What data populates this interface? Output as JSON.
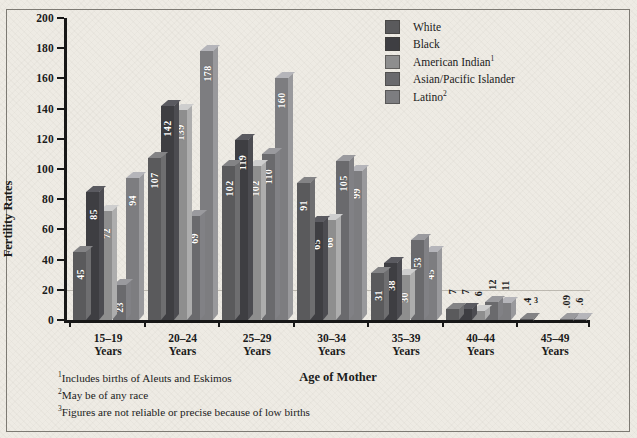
{
  "chart_data": {
    "type": "bar",
    "title": "",
    "xlabel": "Age of Mother",
    "ylabel": "Fertility Rates",
    "ylim": [
      0,
      200
    ],
    "yticks": [
      0,
      20,
      40,
      60,
      80,
      100,
      120,
      140,
      160,
      180,
      200
    ],
    "grid": "single horizontal gridline near 20",
    "legend_position": "top-right",
    "categories": [
      "15–19\nYears",
      "20–24\nYears",
      "25–29\nYears",
      "30–34\nYears",
      "35–39\nYears",
      "40–44\nYears",
      "45–49\nYears"
    ],
    "series": [
      {
        "name": "White",
        "values": [
          45,
          107,
          102,
          91,
          31,
          7,
          0.4
        ],
        "labels": [
          "45",
          "107",
          "102",
          "91",
          "31",
          "7",
          ".4"
        ],
        "color": "#5a5a5c"
      },
      {
        "name": "Black",
        "values": [
          85,
          142,
          119,
          65,
          38,
          7,
          null
        ],
        "labels": [
          "85",
          "142",
          "119",
          "65",
          "38",
          "7",
          ""
        ],
        "color": "#3e3e42"
      },
      {
        "name": "American Indian",
        "values": [
          72,
          139,
          102,
          66,
          30,
          6,
          null
        ],
        "labels": [
          "72",
          "139",
          "102",
          "66",
          "30",
          "6",
          ""
        ],
        "color": "#8e8e8e"
      },
      {
        "name": "Asian/Pacific Islander",
        "values": [
          23,
          69,
          110,
          105,
          53,
          12,
          0.09
        ],
        "labels": [
          "23",
          "69",
          "110",
          "105",
          "53",
          "12",
          ".09"
        ],
        "color": "#6a6a6d"
      },
      {
        "name": "Latino",
        "values": [
          94,
          178,
          160,
          99,
          45,
          11,
          0.6
        ],
        "labels": [
          "94",
          "178",
          "160",
          "99",
          "45",
          "11",
          ".6"
        ],
        "color": "#7d7d80"
      }
    ]
  },
  "axes": {
    "y_title": "Fertility Rates",
    "x_title": "Age of Mother",
    "y_ticks": [
      "200",
      "180",
      "160",
      "140",
      "120",
      "100",
      "80",
      "60",
      "40",
      "20",
      "0"
    ],
    "x_categories": [
      {
        "range": "15–19",
        "unit": "Years"
      },
      {
        "range": "20–24",
        "unit": "Years"
      },
      {
        "range": "25–29",
        "unit": "Years"
      },
      {
        "range": "30–34",
        "unit": "Years"
      },
      {
        "range": "35–39",
        "unit": "Years"
      },
      {
        "range": "40–44",
        "unit": "Years"
      },
      {
        "range": "45–49",
        "unit": "Years"
      }
    ]
  },
  "legend": {
    "items": [
      {
        "label": "White",
        "sup": "",
        "color": "#5a5a5c"
      },
      {
        "label": "Black",
        "sup": "",
        "color": "#3e3e42"
      },
      {
        "label": "American Indian",
        "sup": "1",
        "color": "#8e8e8e"
      },
      {
        "label": "Asian/Pacific Islander",
        "sup": "",
        "color": "#6a6a6d"
      },
      {
        "label": "Latino",
        "sup": "2",
        "color": "#7d7d80"
      }
    ]
  },
  "footnotes": [
    {
      "marker": "1",
      "text": "Includes births of Aleuts and Eskimos"
    },
    {
      "marker": "2",
      "text": "May be of any race"
    },
    {
      "marker": "3",
      "text": "Figures are not reliable or precise because of low births"
    }
  ],
  "annotations": {
    "low_birth_marker": "3"
  }
}
